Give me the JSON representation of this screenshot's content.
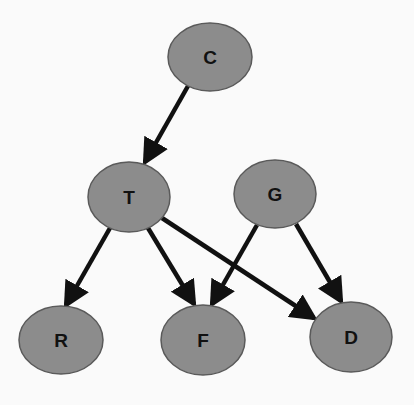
{
  "diagram": {
    "type": "directed-graph",
    "colors": {
      "background": "#fafafa",
      "node_fill": "#8c8c8c",
      "node_stroke": "#5a5a5a",
      "edge": "#111111",
      "label": "#111111"
    },
    "nodes": [
      {
        "id": "C",
        "label": "C",
        "cx": 210,
        "cy": 57,
        "rx": 42,
        "ry": 34
      },
      {
        "id": "T",
        "label": "T",
        "cx": 129,
        "cy": 197,
        "rx": 41,
        "ry": 35
      },
      {
        "id": "G",
        "label": "G",
        "cx": 275,
        "cy": 194,
        "rx": 41,
        "ry": 34
      },
      {
        "id": "R",
        "label": "R",
        "cx": 61,
        "cy": 340,
        "rx": 42,
        "ry": 34
      },
      {
        "id": "F",
        "label": "F",
        "cx": 203,
        "cy": 340,
        "rx": 42,
        "ry": 35
      },
      {
        "id": "D",
        "label": "D",
        "cx": 351,
        "cy": 337,
        "rx": 41,
        "ry": 35
      }
    ],
    "edges": [
      {
        "from": "C",
        "to": "T",
        "x1": 188,
        "y1": 86,
        "x2": 145,
        "y2": 162
      },
      {
        "from": "T",
        "to": "R",
        "x1": 110,
        "y1": 228,
        "x2": 66,
        "y2": 305
      },
      {
        "from": "T",
        "to": "F",
        "x1": 148,
        "y1": 228,
        "x2": 194,
        "y2": 304
      },
      {
        "from": "T",
        "to": "D",
        "x1": 162,
        "y1": 218,
        "x2": 314,
        "y2": 318
      },
      {
        "from": "G",
        "to": "F",
        "x1": 257,
        "y1": 225,
        "x2": 212,
        "y2": 304
      },
      {
        "from": "G",
        "to": "D",
        "x1": 296,
        "y1": 224,
        "x2": 341,
        "y2": 301
      }
    ]
  }
}
